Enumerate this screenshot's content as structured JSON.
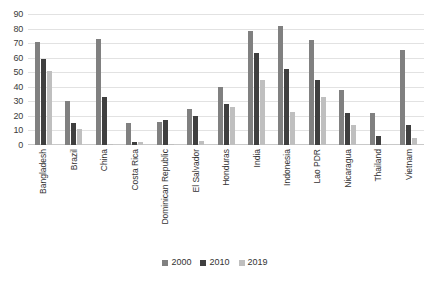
{
  "chart_data": {
    "type": "bar",
    "title": "",
    "xlabel": "",
    "ylabel": "",
    "ylim": [
      0,
      90
    ],
    "yticks": [
      0,
      10,
      20,
      30,
      40,
      50,
      60,
      70,
      80,
      90
    ],
    "grid": true,
    "legend_position": "bottom",
    "categories": [
      "Bangladesh",
      "Brazil",
      "China",
      "Costa Rica",
      "Dominican Republic",
      "El Salvador",
      "Honduras",
      "India",
      "Indonesia",
      "Lao PDR",
      "Nicaragua",
      "Thailand",
      "Vietnam"
    ],
    "series": [
      {
        "name": "2000",
        "color": "#808080",
        "values": [
          71,
          30,
          73,
          15,
          16,
          25,
          40,
          78,
          82,
          72,
          38,
          22,
          65
        ]
      },
      {
        "name": "2010",
        "color": "#3f3f3f",
        "values": [
          59,
          15,
          33,
          2,
          17,
          20,
          28,
          63,
          52,
          45,
          22,
          6,
          14
        ]
      },
      {
        "name": "2019",
        "color": "#bfbfbf",
        "values": [
          51,
          11,
          1,
          2,
          1,
          3,
          26,
          45,
          23,
          33,
          14,
          1,
          5
        ]
      }
    ]
  },
  "legend": {
    "items": [
      {
        "label": "2000",
        "color": "#808080"
      },
      {
        "label": "2010",
        "color": "#3f3f3f"
      },
      {
        "label": "2019",
        "color": "#bfbfbf"
      }
    ]
  }
}
